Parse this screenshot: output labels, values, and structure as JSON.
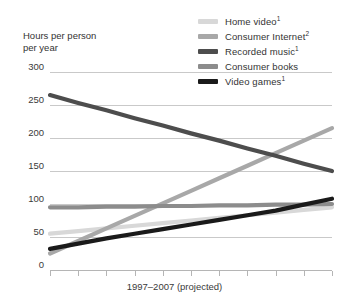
{
  "chart_data": {
    "type": "line",
    "title": "Hours per person\nper year",
    "xlabel": "1997–2007 (projected)",
    "ylabel": "Hours per person per year",
    "ylim": [
      0,
      300
    ],
    "yticks": [
      300,
      250,
      200,
      150,
      100,
      50,
      0
    ],
    "ytick_labels": [
      "300",
      "250",
      "200",
      "150",
      "100",
      "50",
      "0"
    ],
    "grid": true,
    "legend_position": "top-right",
    "x": [
      1997,
      1998,
      1999,
      2000,
      2001,
      2002,
      2003,
      2004,
      2005,
      2006,
      2007
    ],
    "xtick_count": 11,
    "series": [
      {
        "name": "Home video",
        "footnote": "1",
        "color": "#d8d8d8",
        "values": [
          55,
          59,
          63,
          67,
          71,
          75,
          79,
          83,
          87,
          91,
          95
        ]
      },
      {
        "name": "Consumer Internet",
        "footnote": "2",
        "color": "#a8a8a8",
        "values": [
          25,
          44,
          63,
          82,
          101,
          120,
          139,
          158,
          177,
          196,
          215
        ]
      },
      {
        "name": "Recorded music",
        "footnote": "1",
        "color": "#4d4d4d",
        "values": [
          265,
          253,
          242,
          230,
          219,
          207,
          196,
          184,
          173,
          161,
          150
        ]
      },
      {
        "name": "Consumer books",
        "footnote": "",
        "color": "#8c8c8c",
        "values": [
          95,
          95,
          96,
          96,
          97,
          97,
          98,
          98,
          99,
          99,
          100
        ]
      },
      {
        "name": "Video games",
        "footnote": "1",
        "color": "#1a1a1a",
        "values": [
          32,
          40,
          48,
          55,
          62,
          69,
          76,
          83,
          90,
          99,
          108
        ]
      }
    ]
  }
}
